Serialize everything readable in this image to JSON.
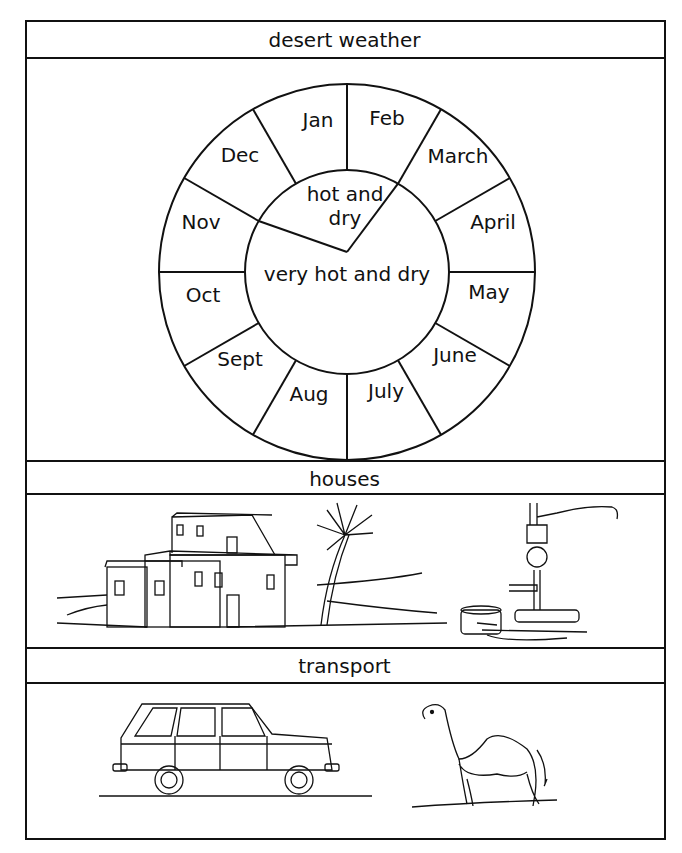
{
  "sections": [
    {
      "title": "desert weather"
    },
    {
      "title": "houses"
    },
    {
      "title": "transport"
    }
  ],
  "weather_wheel": {
    "months": [
      "Jan",
      "Feb",
      "March",
      "April",
      "May",
      "June",
      "July",
      "Aug",
      "Sept",
      "Oct",
      "Nov",
      "Dec"
    ],
    "seasons": [
      {
        "label_line1": "hot and",
        "label_line2": "dry",
        "months": [
          "Dec",
          "Jan",
          "Feb"
        ]
      },
      {
        "label": "very hot and dry",
        "months": [
          "March",
          "April",
          "May",
          "June",
          "July",
          "Aug",
          "Sept",
          "Oct",
          "Nov"
        ]
      }
    ]
  },
  "houses_panel": {
    "illustrations": [
      "flat-roof-house",
      "palm-tree",
      "water-pump"
    ]
  },
  "transport_panel": {
    "illustrations": [
      "car",
      "camel"
    ]
  }
}
